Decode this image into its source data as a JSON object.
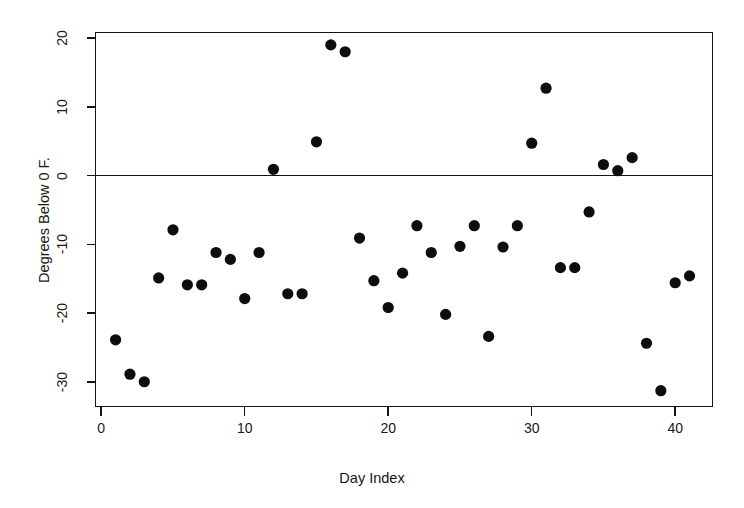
{
  "chart_data": {
    "type": "scatter",
    "title": "",
    "xlabel": "Day Index",
    "ylabel": "Degrees Below 0 F.",
    "xlim": [
      -0.4,
      42.6
    ],
    "ylim": [
      -33.6,
      20.8
    ],
    "xticks": [
      0,
      10,
      20,
      30,
      40
    ],
    "xtick_labels": [
      "0",
      "10",
      "20",
      "30",
      "40"
    ],
    "yticks": [
      20,
      10,
      0,
      -10,
      -20,
      -30
    ],
    "ytick_labels": [
      "20",
      "10",
      "0",
      "-10",
      "-20",
      "-30"
    ],
    "grid": false,
    "legend": null,
    "reference_lines": [
      {
        "axis": "y",
        "value": 0,
        "style": "solid",
        "color": "#141414"
      }
    ],
    "marker": {
      "shape": "circle",
      "color": "#0d0d0d",
      "size": 5.6
    },
    "frame": true,
    "series": [
      {
        "name": "Daily minimum temperature",
        "x": [
          1,
          2,
          3,
          4,
          5,
          6,
          7,
          8,
          9,
          10,
          11,
          12,
          13,
          14,
          15,
          16,
          17,
          18,
          19,
          20,
          21,
          22,
          23,
          24,
          25,
          26,
          27,
          28,
          29,
          30,
          31,
          32,
          33,
          34,
          35,
          36,
          37,
          38,
          39,
          40,
          41
        ],
        "y": [
          -23.9,
          -28.9,
          -30.0,
          -14.9,
          -7.9,
          -15.9,
          -15.9,
          -11.2,
          -12.2,
          -17.9,
          -11.2,
          0.9,
          -17.2,
          -17.2,
          4.9,
          19.0,
          18.0,
          -9.1,
          -15.3,
          -19.2,
          -14.2,
          -7.3,
          -11.2,
          -20.2,
          -10.3,
          -7.3,
          -23.4,
          -10.4,
          -7.3,
          4.7,
          12.7,
          -13.4,
          -13.4,
          -5.3,
          1.6,
          0.7,
          2.6,
          -24.4,
          -31.3,
          -15.6,
          -14.6
        ]
      }
    ],
    "point_count": 41
  },
  "axes": {
    "y_title": "Degrees Below 0 F.",
    "x_title": "Day Index"
  }
}
